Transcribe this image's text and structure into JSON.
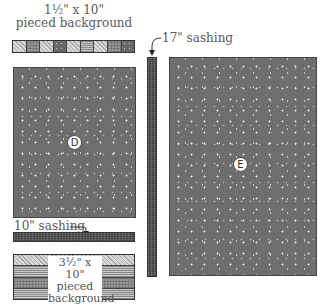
{
  "diagram": {
    "top_strip": {
      "label_line1": "1½\" x 10\"",
      "label_line2": "pieced background",
      "squares": [
        "light",
        "mid",
        "light",
        "dark",
        "light",
        "mid",
        "light",
        "mid",
        "dark"
      ]
    },
    "block_d": {
      "letter": "D",
      "color": "#6e6e6e"
    },
    "block_e": {
      "letter": "E",
      "color": "#6e6e6e"
    },
    "vertical_sashing": {
      "label": "17\" sashing"
    },
    "horizontal_sashing": {
      "label": "10\" sashing"
    },
    "bottom_strip": {
      "label_line1": "3½\" x 10\"",
      "label_line2": "pieced",
      "label_line3": "background",
      "rows": [
        "light",
        "grid",
        "mid",
        "grid"
      ]
    }
  }
}
